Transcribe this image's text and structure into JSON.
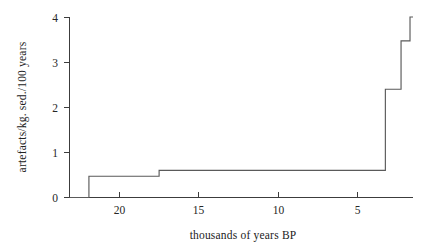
{
  "chart_data": {
    "type": "line",
    "subtype": "step-histogram",
    "title": "",
    "xlabel": "thousands of years BP",
    "ylabel": "artefacts/kg. sed./100 years",
    "xlim": [
      23.5,
      0.5
    ],
    "ylim": [
      0,
      4
    ],
    "x_axis_reversed": true,
    "grid": false,
    "legend": null,
    "xticks": [
      20,
      15,
      10,
      5
    ],
    "xtick_labels": [
      "20",
      "15",
      "10",
      "5"
    ],
    "yticks": [
      0,
      1,
      2,
      3,
      4
    ],
    "ytick_labels": [
      "0",
      "1",
      "2",
      "3",
      "4"
    ],
    "series": [
      {
        "name": "artefact density",
        "color": "#5a5a5a",
        "step_bins": [
          {
            "x_start": 23.5,
            "x_end": 22.2,
            "value": 0.0
          },
          {
            "x_start": 22.2,
            "x_end": 17.5,
            "value": 0.47
          },
          {
            "x_start": 17.5,
            "x_end": 2.35,
            "value": 0.6
          },
          {
            "x_start": 2.35,
            "x_end": 1.3,
            "value": 2.4
          },
          {
            "x_start": 1.3,
            "x_end": 0.7,
            "value": 3.47
          },
          {
            "x_start": 0.7,
            "x_end": 0.5,
            "value": 4.0
          }
        ],
        "x": [
          23.5,
          22.2,
          22.2,
          17.5,
          17.5,
          2.35,
          2.35,
          1.3,
          1.3,
          0.7,
          0.7,
          0.5
        ],
        "y": [
          0.0,
          0.0,
          0.47,
          0.47,
          0.6,
          0.6,
          2.4,
          2.4,
          3.47,
          3.47,
          4.0,
          4.0
        ]
      }
    ]
  },
  "figure": {
    "background_color": "#ffffff",
    "axis_color": "#3c3c3c",
    "line_color": "#5a5a5a"
  }
}
